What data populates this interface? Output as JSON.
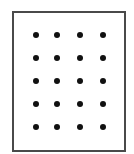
{
  "diagram": {
    "type": "dot-grid",
    "rows": 5,
    "columns": 4,
    "dot_count": 20,
    "colors": {
      "frame": "#4a4a4a",
      "dot": "#111111",
      "background": "#ffffff"
    },
    "column_x": [
      36,
      57,
      80,
      103
    ],
    "row_y": [
      35,
      58,
      81,
      104,
      127
    ]
  }
}
